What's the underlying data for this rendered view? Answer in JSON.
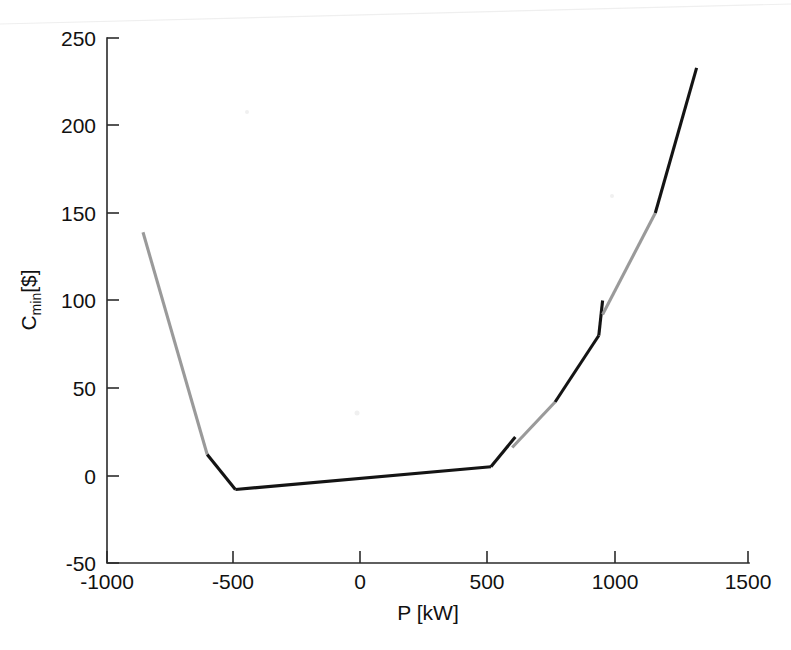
{
  "figure": {
    "background_color": "#ffffff",
    "plot_area": {
      "x0": 107,
      "y0": 38,
      "x1": 749,
      "y1": 563
    }
  },
  "chart_data": {
    "type": "line",
    "title": "",
    "xlabel": "P [kW]",
    "ylabel": "C_min [$]",
    "ylabel_base": "C",
    "ylabel_sub": "min",
    "ylabel_unit": "[$]",
    "xlim": [
      -1000,
      1500
    ],
    "ylim": [
      -50,
      250
    ],
    "xticks": [
      -1000,
      -500,
      0,
      500,
      1000,
      1500
    ],
    "xticklabels": [
      "-1000",
      "-500",
      "0",
      "500",
      "1000",
      "1500"
    ],
    "yticks": [
      -50,
      0,
      50,
      100,
      150,
      200,
      250
    ],
    "yticklabels": [
      "-50",
      "0",
      "50",
      "100",
      "150",
      "200",
      "250"
    ],
    "grid": false,
    "legend": null,
    "colors": {
      "dark": "#141414",
      "light": "#9a9a9a"
    },
    "series": [
      {
        "name": "C_min vs P",
        "note": "Single piecewise curve, drawn in alternating dark and light segments, with a small discontinuity near P=560 and another near P=930.",
        "x": [
          -860,
          -710,
          -530,
          -500,
          -395,
          -200,
          0,
          200,
          400,
          490,
          500,
          590,
          595,
          600,
          640,
          700,
          780,
          860,
          900,
          925,
          930,
          935,
          960,
          1000,
          1060,
          1110,
          1150,
          1200,
          1260,
          1296
        ],
        "y": [
          139,
          80,
          16,
          11,
          -8,
          -6,
          -3,
          0,
          3,
          5,
          5,
          15,
          22,
          18,
          24,
          32,
          42,
          57,
          68,
          80,
          100,
          95,
          110,
          122,
          136,
          148,
          152,
          170,
          198,
          233
        ]
      }
    ],
    "segments": [
      {
        "shade": "light",
        "points": [
          [
            -860,
            139
          ],
          [
            -610,
            12
          ]
        ]
      },
      {
        "shade": "dark",
        "points": [
          [
            -610,
            12
          ],
          [
            -500,
            -8
          ]
        ]
      },
      {
        "shade": "dark",
        "points": [
          [
            -500,
            -8
          ],
          [
            495,
            5
          ]
        ]
      },
      {
        "shade": "dark",
        "points": [
          [
            495,
            5
          ],
          [
            590,
            22
          ]
        ]
      },
      {
        "shade": "light",
        "points": [
          [
            578,
            16
          ],
          [
            745,
            42
          ]
        ]
      },
      {
        "shade": "dark",
        "points": [
          [
            745,
            42
          ],
          [
            915,
            80
          ]
        ]
      },
      {
        "shade": "dark",
        "points": [
          [
            915,
            80
          ],
          [
            930,
            100
          ]
        ]
      },
      {
        "shade": "light",
        "points": [
          [
            930,
            92
          ],
          [
            1135,
            150
          ]
        ]
      },
      {
        "shade": "dark",
        "points": [
          [
            1135,
            150
          ],
          [
            1296,
            233
          ]
        ]
      }
    ]
  }
}
